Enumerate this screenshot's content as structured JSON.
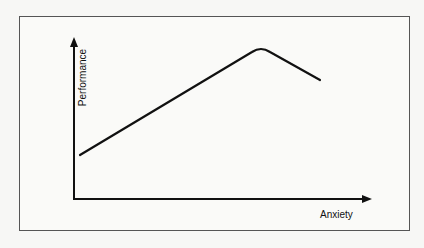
{
  "diagram": {
    "title": "",
    "y_axis_label": "Performance",
    "x_axis_label": "Anxiety",
    "curve": {
      "description": "Performance rises linearly with anxiety, peaks, then declines",
      "points": [
        [
          80,
          155
        ],
        [
          255,
          50
        ],
        [
          268,
          50
        ],
        [
          320,
          80
        ]
      ]
    },
    "colors": {
      "line": "#111111",
      "frame": "#555555",
      "background": "#fafaf8"
    }
  }
}
